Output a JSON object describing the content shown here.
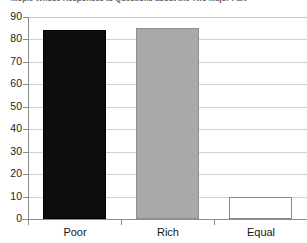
{
  "chart_data": {
    "type": "bar",
    "title": "...ople Whose Responses to Questions about the Two Major Part",
    "title_clipped": true,
    "xlabel": "",
    "ylabel": "",
    "categories": [
      "Poor",
      "Rich",
      "Equal"
    ],
    "values": [
      84,
      85,
      10
    ],
    "series": [
      {
        "name": "Responses",
        "values": [
          84,
          85,
          10
        ],
        "colors": [
          "#0d0d0d",
          "#a9a9a9",
          "#ffffff"
        ]
      }
    ],
    "ylim": [
      0,
      90
    ],
    "yticks": [
      0,
      10,
      20,
      30,
      40,
      50,
      60,
      70,
      80,
      90
    ],
    "ytick_labels": [
      "0",
      "10",
      "20",
      "30",
      "40",
      "50",
      "60",
      "70",
      "80",
      "90"
    ],
    "grid": true,
    "grid_axis": "y",
    "legend": false,
    "legend_position": "none",
    "bar_colors": {
      "poor": "#0d0d0d",
      "rich": "#a9a9a9",
      "equal": "#ffffff"
    },
    "axis_color": "#8a8a8a",
    "gridline_color": "#d2d2d2"
  }
}
